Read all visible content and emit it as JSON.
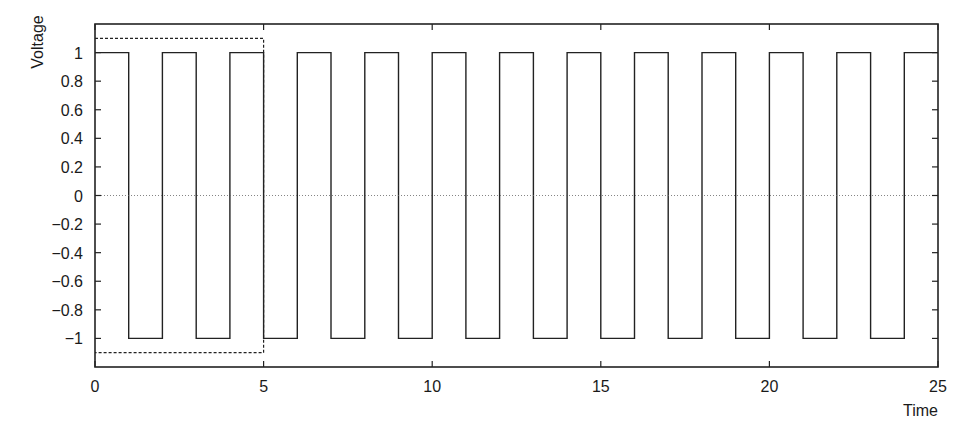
{
  "chart_data": {
    "type": "line",
    "title": "",
    "xlabel": "Time",
    "ylabel": "Voltage",
    "xlim": [
      0,
      25
    ],
    "ylim": [
      -1.2,
      1.2
    ],
    "grid": false,
    "legend": null,
    "x_ticks": [
      0,
      5,
      10,
      15,
      20,
      25
    ],
    "x_tick_labels": [
      "0",
      "5",
      "10",
      "15",
      "20",
      "25"
    ],
    "y_ticks": [
      1,
      0.8,
      0.6,
      0.4,
      0.2,
      0,
      -0.2,
      -0.4,
      -0.6,
      -0.8,
      -1
    ],
    "y_tick_labels": [
      "1",
      "0.8",
      "0.6",
      "0.4",
      "0.2",
      "0",
      "−0.2",
      "−0.4",
      "−0.6",
      "−0.8",
      "−1"
    ],
    "series": [
      {
        "name": "square wave",
        "style": "solid",
        "description": "Square wave, period 2, amplitude 1: +1 on [2k, 2k+1), -1 on [2k+1, 2k+2)",
        "x": [
          0,
          1,
          1,
          2,
          2,
          3,
          3,
          4,
          4,
          5,
          5,
          6,
          6,
          7,
          7,
          8,
          8,
          9,
          9,
          10,
          10,
          11,
          11,
          12,
          12,
          13,
          13,
          14,
          14,
          15,
          15,
          16,
          16,
          17,
          17,
          18,
          18,
          19,
          19,
          20,
          20,
          21,
          21,
          22,
          22,
          23,
          23,
          24,
          24,
          25
        ],
        "y": [
          1,
          1,
          -1,
          -1,
          1,
          1,
          -1,
          -1,
          1,
          1,
          -1,
          -1,
          1,
          1,
          -1,
          -1,
          1,
          1,
          -1,
          -1,
          1,
          1,
          -1,
          -1,
          1,
          1,
          -1,
          -1,
          1,
          1,
          -1,
          -1,
          1,
          1,
          -1,
          -1,
          1,
          1,
          -1,
          -1,
          1,
          1,
          -1,
          -1,
          1,
          1,
          -1,
          -1,
          1,
          1
        ]
      },
      {
        "name": "zero reference",
        "style": "dotted",
        "x": [
          0,
          25
        ],
        "y": [
          0,
          0
        ]
      },
      {
        "name": "envelope box",
        "style": "dashed",
        "x": [
          0,
          5,
          5,
          0
        ],
        "y": [
          1.1,
          1.1,
          -1.1,
          -1.1
        ]
      }
    ]
  },
  "labels": {
    "xlabel": "Time",
    "ylabel": "Voltage"
  }
}
